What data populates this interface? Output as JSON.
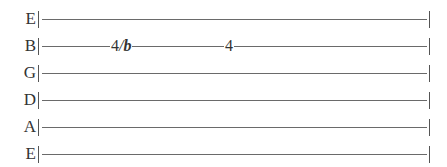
{
  "tablature": {
    "strings": [
      {
        "name": "E",
        "notes": []
      },
      {
        "name": "B",
        "notes": [
          {
            "fret": "4",
            "technique": "/",
            "modifier": "b"
          },
          {
            "fret": "4",
            "technique": "",
            "modifier": ""
          }
        ]
      },
      {
        "name": "G",
        "notes": []
      },
      {
        "name": "D",
        "notes": []
      },
      {
        "name": "A",
        "notes": []
      },
      {
        "name": "E",
        "notes": []
      }
    ]
  }
}
